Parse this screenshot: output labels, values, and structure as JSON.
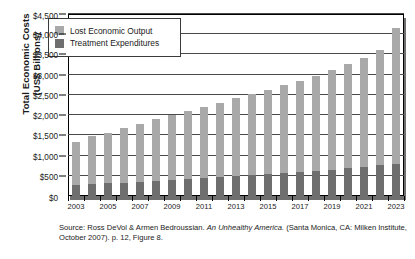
{
  "chart_data": {
    "type": "bar",
    "stacked": true,
    "title": "",
    "xlabel": "",
    "ylabel": "Total Economic Costs (US$ Billions)",
    "ylabel_line1": "Total Economic Costs",
    "ylabel_line2": "(US$ Billions)",
    "ylim": [
      0,
      4500
    ],
    "ytick_step": 500,
    "ytick_labels": [
      "$0",
      "$500",
      "$1,000",
      "$1,500",
      "$2,000",
      "$2,500",
      "$3,000",
      "$3,500",
      "$4,000",
      "$4,500"
    ],
    "ytick_values": [
      0,
      500,
      1000,
      1500,
      2000,
      2500,
      3000,
      3500,
      4000,
      4500
    ],
    "grid": true,
    "legend_position": "top-left",
    "categories": [
      2003,
      2004,
      2005,
      2006,
      2007,
      2008,
      2009,
      2010,
      2011,
      2012,
      2013,
      2014,
      2015,
      2016,
      2017,
      2018,
      2019,
      2020,
      2021,
      2022,
      2023
    ],
    "xtick_labels": [
      "2003",
      "2005",
      "2007",
      "2009",
      "2011",
      "2013",
      "2015",
      "2017",
      "2019",
      "2021",
      "2023"
    ],
    "xtick_label_years": [
      2003,
      2005,
      2007,
      2009,
      2011,
      2013,
      2015,
      2017,
      2019,
      2021,
      2023
    ],
    "series": [
      {
        "name": "Treatment Expenditures",
        "color": "#6e6e6e",
        "values": [
          280,
          295,
          310,
          330,
          350,
          375,
          395,
          420,
          440,
          460,
          485,
          510,
          535,
          560,
          590,
          620,
          655,
          690,
          720,
          760,
          795
        ]
      },
      {
        "name": "Lost Economic Output",
        "color": "#a9a9a9",
        "values": [
          1050,
          1180,
          1240,
          1350,
          1420,
          1520,
          1605,
          1690,
          1770,
          1850,
          1930,
          2015,
          2095,
          2180,
          2260,
          2350,
          2455,
          2580,
          2690,
          2840,
          3355
        ]
      }
    ],
    "totals": [
      1330,
      1475,
      1550,
      1680,
      1770,
      1895,
      2000,
      2110,
      2210,
      2310,
      2415,
      2525,
      2630,
      2740,
      2850,
      2970,
      3110,
      3270,
      3410,
      3600,
      4150
    ]
  },
  "legend": {
    "items": [
      {
        "label": "Lost Economic Output",
        "color": "#a9a9a9"
      },
      {
        "label": "Treatment Expenditures",
        "color": "#6e6e6e"
      }
    ]
  },
  "source": {
    "prefix": "Source: Ross DeVol & Armen Bedroussian. ",
    "italic_title": "An Unhealthy America.",
    "suffix": " (Santa Monica, CA: Milken Institute, October 2007). p. 12, Figure 8."
  }
}
